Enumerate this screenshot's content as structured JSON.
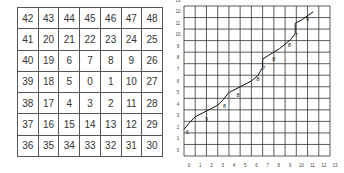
{
  "spiral_grid": {
    "rows": [
      [
        "42",
        "43",
        "44",
        "45",
        "46",
        "47",
        "48"
      ],
      [
        "41",
        "20",
        "21",
        "22",
        "23",
        "24",
        "25"
      ],
      [
        "40",
        "19",
        "6",
        "7",
        "8",
        "9",
        "26"
      ],
      [
        "39",
        "18",
        "5",
        "0",
        "1",
        "10",
        "27"
      ],
      [
        "38",
        "17",
        "4",
        "3",
        "2",
        "11",
        "28"
      ],
      [
        "37",
        "16",
        "15",
        "14",
        "13",
        "12",
        "29"
      ],
      [
        "36",
        "35",
        "34",
        "33",
        "32",
        "31",
        "30"
      ]
    ]
  },
  "path_plot": {
    "x_ticks": [
      "0",
      "1",
      "2",
      "3",
      "4",
      "5",
      "6",
      "7",
      "8",
      "9",
      "10",
      "11",
      "12",
      "13"
    ],
    "y_ticks": [
      "0",
      "1",
      "2",
      "3",
      "4",
      "5",
      "6",
      "7",
      "8",
      "9",
      "10",
      "11",
      "12",
      "13"
    ],
    "curve_points": [
      [
        0,
        1.8
      ],
      [
        0.4,
        2.3
      ],
      [
        1,
        2.9
      ],
      [
        2,
        3.4
      ],
      [
        3,
        3.9
      ],
      [
        3.5,
        4.4
      ],
      [
        4,
        5
      ],
      [
        5,
        5.5
      ],
      [
        6,
        6
      ],
      [
        6.6,
        6.5
      ],
      [
        7,
        7.2
      ],
      [
        7,
        7.9
      ],
      [
        7.5,
        8.2
      ],
      [
        8.5,
        8.8
      ],
      [
        9.5,
        9.6
      ],
      [
        9.9,
        10.1
      ],
      [
        9.9,
        11
      ],
      [
        10.5,
        11.3
      ],
      [
        11.5,
        12
      ]
    ],
    "point_labels": [
      {
        "x": 0.3,
        "y": 1.6,
        "text": "6"
      },
      {
        "x": 2,
        "y": 2.7,
        "text": "9"
      },
      {
        "x": 3.6,
        "y": 3.8,
        "text": "8"
      },
      {
        "x": 4.8,
        "y": 4.8,
        "text": "8"
      },
      {
        "x": 6.6,
        "y": 6.2,
        "text": "8"
      },
      {
        "x": 7.1,
        "y": 7.1,
        "text": "7"
      },
      {
        "x": 8,
        "y": 7.9,
        "text": "8"
      },
      {
        "x": 9.4,
        "y": 9.1,
        "text": "8"
      },
      {
        "x": 10,
        "y": 10,
        "text": "7"
      },
      {
        "x": 11,
        "y": 11.4,
        "text": "9"
      }
    ]
  }
}
